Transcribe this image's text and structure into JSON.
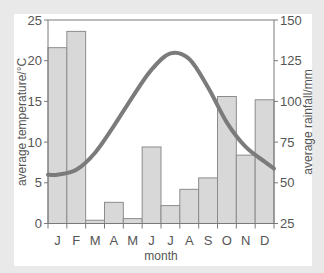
{
  "chart_data": {
    "type": "bar+line",
    "title": "",
    "categories": [
      "J",
      "F",
      "M",
      "A",
      "M",
      "J",
      "J",
      "A",
      "S",
      "O",
      "N",
      "D"
    ],
    "xlabel": "month",
    "series": [
      {
        "name": "average rainfall",
        "type": "bar",
        "axis": "right",
        "values": [
          133,
          143,
          27,
          38,
          28,
          72,
          36,
          46,
          53,
          103,
          67,
          101
        ]
      },
      {
        "name": "average temperature",
        "type": "line",
        "axis": "left",
        "values": [
          6.0,
          6.6,
          8.7,
          12.0,
          15.6,
          18.9,
          20.9,
          20.2,
          16.7,
          12.4,
          9.4,
          7.6
        ]
      }
    ],
    "left_axis": {
      "label": "average temperature/°C",
      "ylim": [
        0,
        25
      ],
      "ticks": [
        0,
        5,
        10,
        15,
        20,
        25
      ]
    },
    "right_axis": {
      "label": "average rainfall/mm",
      "ylim": [
        25,
        150
      ],
      "ticks": [
        25,
        50,
        75,
        100,
        125,
        150
      ]
    },
    "grid": false,
    "legend": "none"
  },
  "colors": {
    "bar_fill": "#d8d8d8",
    "bar_stroke": "#8c8c8c",
    "line": "#7b7b7b",
    "axis": "#7a7a7a",
    "text": "#555555"
  }
}
